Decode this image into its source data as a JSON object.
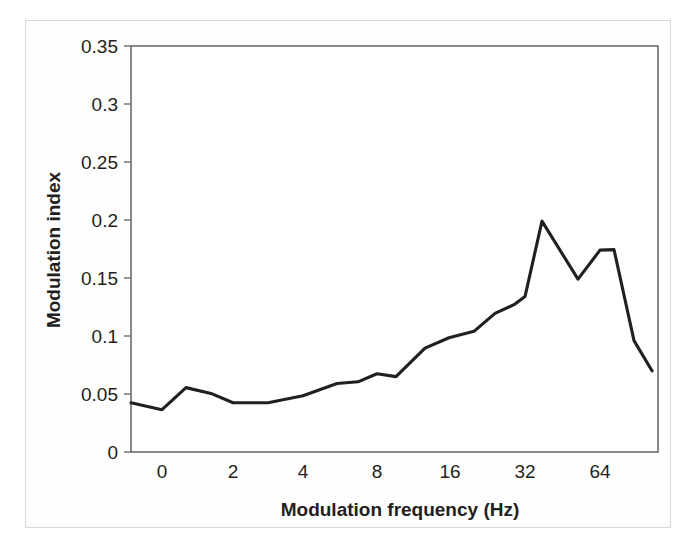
{
  "figure": {
    "background_color": "#ffffff",
    "frame_color": "#6d6d6d",
    "line_color": "#231f20",
    "text_color": "#231f20"
  },
  "axes": {
    "y_title": "Modulation index",
    "x_title": "Modulation frequency (Hz)",
    "y_ticks": [
      "0",
      "0.05",
      "0.1",
      "0.15",
      "0.2",
      "0.25",
      "0.3",
      "0.35"
    ],
    "x_ticks": [
      "0",
      "2",
      "4",
      "8",
      "16",
      "32",
      "64"
    ]
  },
  "chart_data": {
    "type": "line",
    "title": "",
    "xlabel": "Modulation frequency (Hz)",
    "ylabel": "Modulation index",
    "xlim": [
      0,
      1
    ],
    "ylim": [
      0,
      0.35
    ],
    "x_scale": "log-like (labelled 0, 2, 4, 8, 16, 32, 64)",
    "grid": false,
    "legend": null,
    "x_tick_values": [
      0,
      2,
      4,
      8,
      16,
      32,
      64
    ],
    "y_tick_values": [
      0,
      0.05,
      0.1,
      0.15,
      0.2,
      0.25,
      0.3,
      0.35
    ],
    "series": [
      {
        "name": "Modulation index",
        "color": "#231f20",
        "x_tick_labels": [
          "",
          "0",
          "",
          "2",
          "3",
          "4",
          "",
          "8",
          "",
          "",
          "16",
          "",
          "32",
          "",
          "",
          "64",
          "",
          ""
        ],
        "points": [
          {
            "x_px": 131,
            "x_label": "",
            "y": 0.0425
          },
          {
            "x_px": 162,
            "x_label": "0",
            "y": 0.0365
          },
          {
            "x_px": 186,
            "x_label": "",
            "y": 0.0555
          },
          {
            "x_px": 211,
            "x_label": "",
            "y": 0.0505
          },
          {
            "x_px": 233,
            "x_label": "2",
            "y": 0.0425
          },
          {
            "x_px": 268,
            "x_label": "3",
            "y": 0.0425
          },
          {
            "x_px": 303,
            "x_label": "4",
            "y": 0.0485
          },
          {
            "x_px": 337,
            "x_label": "",
            "y": 0.059
          },
          {
            "x_px": 358,
            "x_label": "",
            "y": 0.0605
          },
          {
            "x_px": 377,
            "x_label": "8",
            "y": 0.0675
          },
          {
            "x_px": 396,
            "x_label": "",
            "y": 0.065
          },
          {
            "x_px": 425,
            "x_label": "",
            "y": 0.0895
          },
          {
            "x_px": 449,
            "x_label": "",
            "y": 0.0985
          },
          {
            "x_px": 474,
            "x_label": "16",
            "y": 0.104
          },
          {
            "x_px": 495,
            "x_label": "",
            "y": 0.1195
          },
          {
            "x_px": 514,
            "x_label": "",
            "y": 0.127
          },
          {
            "x_px": 525,
            "x_label": "32",
            "y": 0.134
          },
          {
            "x_px": 542,
            "x_label": "",
            "y": 0.199
          },
          {
            "x_px": 578,
            "x_label": "",
            "y": 0.149
          },
          {
            "x_px": 600,
            "x_label": "",
            "y": 0.174
          },
          {
            "x_px": 614,
            "x_label": "64",
            "y": 0.1745
          },
          {
            "x_px": 634,
            "x_label": "",
            "y": 0.096
          },
          {
            "x_px": 652,
            "x_label": "",
            "y": 0.07
          }
        ]
      }
    ]
  }
}
